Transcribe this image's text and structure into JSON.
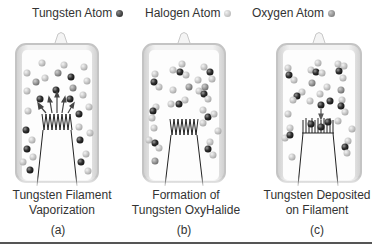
{
  "legend": [
    {
      "label": "Tungsten Atom",
      "color": "#2b2b2b"
    },
    {
      "label": "Halogen Atom",
      "color": "#bdbdbd"
    },
    {
      "label": "Oxygen Atom",
      "color": "#8a8a8a"
    }
  ],
  "panels": [
    {
      "caption_line1": "Tungsten Filament",
      "caption_line2": "Vaporization",
      "letter": "(a)"
    },
    {
      "caption_line1": "Formation of",
      "caption_line2": "Tungsten OxyHalide",
      "letter": "(b)"
    },
    {
      "caption_line1": "Tungsten Deposited",
      "caption_line2": "on Filament",
      "letter": "(c)"
    }
  ],
  "colors": {
    "tungsten": "#2b2b2b",
    "halogen": "#c4c4c4",
    "oxygen": "#8c8c8c",
    "glass": "#d8d8d8"
  }
}
